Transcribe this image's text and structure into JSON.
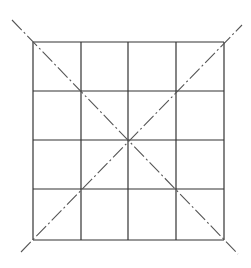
{
  "diagram": {
    "type": "grid-with-diagonals",
    "rows": 4,
    "cols": 4,
    "grid": {
      "left": 33,
      "top": 42,
      "right": 224,
      "bottom": 240
    },
    "h_lines": [
      42,
      91,
      140,
      189,
      240
    ],
    "v_lines": [
      33,
      81,
      128,
      176,
      224
    ],
    "diagonals": [
      {
        "x1": 12,
        "y1": 20,
        "x2": 238,
        "y2": 254,
        "style": "dash-dot"
      },
      {
        "x1": 21,
        "y1": 252,
        "x2": 242,
        "y2": 25,
        "style": "dash-dot"
      }
    ],
    "colors": {
      "line": "#333333",
      "dash": "#555555",
      "background": "#ffffff"
    }
  }
}
